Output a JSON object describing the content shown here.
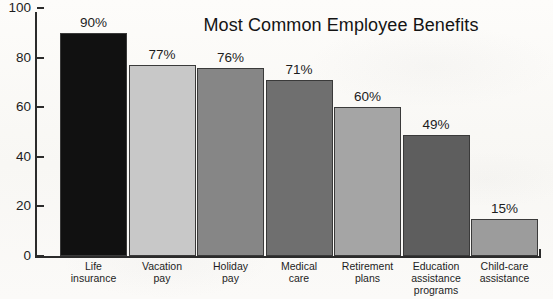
{
  "chart_data": {
    "type": "bar",
    "title": "Most Common Employee Benefits",
    "xlabel": "",
    "ylabel": "",
    "ylim": [
      0,
      100
    ],
    "yticks": [
      0,
      20,
      40,
      60,
      80,
      100
    ],
    "grid": false,
    "legend": null,
    "categories": [
      "Life\ninsurance",
      "Vacation\npay",
      "Holiday\npay",
      "Medical\ncare",
      "Retirement\nplans",
      "Education\nassistance\nprograms",
      "Child-care\nassistance"
    ],
    "values": [
      90,
      77,
      76,
      71,
      60,
      49,
      15
    ],
    "value_labels": [
      "90%",
      "77%",
      "76%",
      "71%",
      "60%",
      "49%",
      "15%"
    ],
    "bar_colors": [
      "#111111",
      "#c8c8c8",
      "#868686",
      "#6f6f6f",
      "#a5a5a5",
      "#5e5e5e",
      "#9c9c9c"
    ],
    "bar_outline_color": "#3a3a3a",
    "axis_color": "#2b2b2b",
    "background_color": "#fbfaf8",
    "text_color": "#1d1d1d"
  }
}
